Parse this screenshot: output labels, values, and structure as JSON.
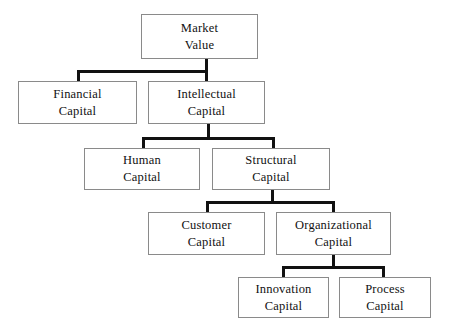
{
  "diagram": {
    "type": "hierarchy-tree",
    "style": {
      "box_border_color": "#8a8a8a",
      "connector_color": "#111111",
      "background_color": "#ffffff",
      "text_color": "#111111"
    },
    "nodes": [
      {
        "id": "market-value",
        "line1": "Market",
        "line2": "Value",
        "level": 0,
        "x": 141,
        "y": 14,
        "w": 117,
        "h": 45
      },
      {
        "id": "financial-capital",
        "line1": "Financial",
        "line2": "Capital",
        "level": 1,
        "x": 18,
        "y": 81,
        "w": 119,
        "h": 43
      },
      {
        "id": "intellectual-capital",
        "line1": "Intellectual",
        "line2": "Capital",
        "level": 1,
        "x": 148,
        "y": 81,
        "w": 117,
        "h": 43
      },
      {
        "id": "human-capital",
        "line1": "Human",
        "line2": "Capital",
        "level": 2,
        "x": 84,
        "y": 148,
        "w": 116,
        "h": 42
      },
      {
        "id": "structural-capital",
        "line1": "Structural",
        "line2": "Capital",
        "level": 2,
        "x": 212,
        "y": 148,
        "w": 118,
        "h": 42
      },
      {
        "id": "customer-capital",
        "line1": "Customer",
        "line2": "Capital",
        "level": 3,
        "x": 148,
        "y": 212,
        "w": 117,
        "h": 43
      },
      {
        "id": "organizational-capital",
        "line1": "Organizational",
        "line2": "Capital",
        "level": 3,
        "x": 276,
        "y": 212,
        "w": 115,
        "h": 43
      },
      {
        "id": "innovation-capital",
        "line1": "Innovation",
        "line2": "Capital",
        "level": 4,
        "x": 238,
        "y": 277,
        "w": 91,
        "h": 41
      },
      {
        "id": "process-capital",
        "line1": "Process",
        "line2": "Capital",
        "level": 4,
        "x": 339,
        "y": 277,
        "w": 92,
        "h": 41
      }
    ],
    "edges": [
      {
        "from": "market-value",
        "to": "financial-capital"
      },
      {
        "from": "market-value",
        "to": "intellectual-capital"
      },
      {
        "from": "intellectual-capital",
        "to": "human-capital"
      },
      {
        "from": "intellectual-capital",
        "to": "structural-capital"
      },
      {
        "from": "structural-capital",
        "to": "customer-capital"
      },
      {
        "from": "structural-capital",
        "to": "organizational-capital"
      },
      {
        "from": "organizational-capital",
        "to": "innovation-capital"
      },
      {
        "from": "organizational-capital",
        "to": "process-capital"
      }
    ],
    "connectors": [
      {
        "id": "mv-stem",
        "orient": "v",
        "x": 205,
        "y": 59,
        "len": 13
      },
      {
        "id": "mv-bar",
        "orient": "h",
        "x": 77,
        "y": 70,
        "len": 131
      },
      {
        "id": "mv-to-financial",
        "orient": "v",
        "x": 77,
        "y": 70,
        "len": 12
      },
      {
        "id": "mv-to-intel",
        "orient": "v",
        "x": 205,
        "y": 70,
        "len": 12
      },
      {
        "id": "ic-stem",
        "orient": "v",
        "x": 207,
        "y": 124,
        "len": 14
      },
      {
        "id": "ic-bar",
        "orient": "h",
        "x": 142,
        "y": 137,
        "len": 133
      },
      {
        "id": "ic-to-human",
        "orient": "v",
        "x": 142,
        "y": 137,
        "len": 12
      },
      {
        "id": "ic-to-struct",
        "orient": "v",
        "x": 272,
        "y": 137,
        "len": 12
      },
      {
        "id": "sc-stem",
        "orient": "v",
        "x": 271,
        "y": 190,
        "len": 12
      },
      {
        "id": "sc-bar",
        "orient": "h",
        "x": 206,
        "y": 201,
        "len": 129
      },
      {
        "id": "sc-to-customer",
        "orient": "v",
        "x": 206,
        "y": 201,
        "len": 12
      },
      {
        "id": "sc-to-org",
        "orient": "v",
        "x": 332,
        "y": 201,
        "len": 12
      },
      {
        "id": "oc-stem",
        "orient": "v",
        "x": 332,
        "y": 255,
        "len": 12
      },
      {
        "id": "oc-bar",
        "orient": "h",
        "x": 282,
        "y": 266,
        "len": 103
      },
      {
        "id": "oc-to-innov",
        "orient": "v",
        "x": 282,
        "y": 266,
        "len": 12
      },
      {
        "id": "oc-to-process",
        "orient": "v",
        "x": 382,
        "y": 266,
        "len": 12
      }
    ]
  }
}
